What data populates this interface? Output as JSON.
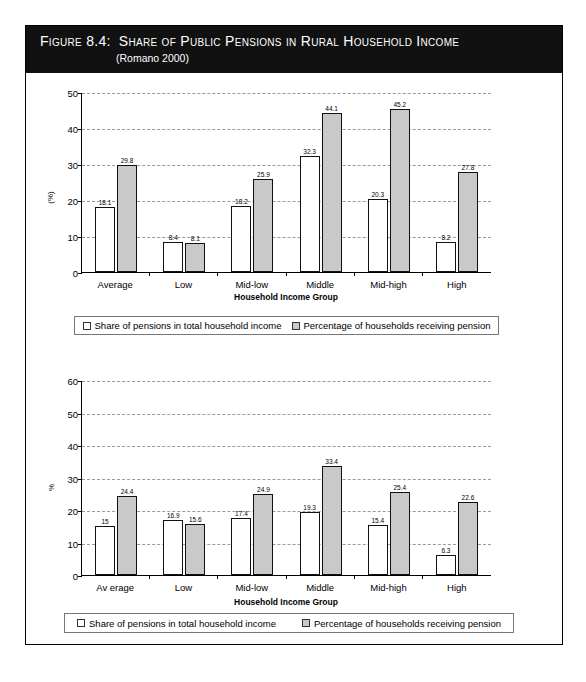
{
  "figure": {
    "number_label": "Figure 8.4:",
    "title": "Share of Public Pensions in Rural Household Income",
    "subtitle": "(Romano 2000)"
  },
  "colors": {
    "series_white": "#ffffff",
    "series_gray": "#c9c9c9",
    "header_background": "#111111",
    "header_text": "#ffffff",
    "gridline": "#9a9a9a",
    "axis": "#000000"
  },
  "legend": {
    "series_1": "Share of pensions in total household income",
    "series_2": "Percentage of households receiving pension"
  },
  "chart_data": [
    {
      "type": "bar",
      "title": "",
      "xlabel": "Household Income Group",
      "ylabel": "(%)",
      "categories": [
        "Average",
        "Low",
        "Mid-low",
        "Middle",
        "Mid-high",
        "High"
      ],
      "series": [
        {
          "name": "Share of pensions in total household income",
          "color": "#ffffff",
          "values": [
            18.1,
            8.4,
            18.2,
            32.3,
            20.3,
            8.2
          ],
          "labels": [
            "18.1",
            "8.4",
            "18.2",
            "32.3",
            "20.3",
            "8.2"
          ]
        },
        {
          "name": "Percentage of households receiving pension",
          "color": "#c9c9c9",
          "values": [
            29.8,
            8.1,
            25.9,
            44.1,
            45.2,
            27.8
          ],
          "labels": [
            "29.8",
            "8.1",
            "25.9",
            "44.1",
            "45.2",
            "27.8"
          ]
        }
      ],
      "ylim": [
        0,
        50
      ],
      "yticks": [
        0,
        10,
        20,
        30,
        40,
        50
      ],
      "ytick_labels": [
        "0",
        "10",
        "20",
        "30",
        "40",
        "50"
      ],
      "grid": true,
      "legend_position": "bottom"
    },
    {
      "type": "bar",
      "title": "",
      "xlabel": "Household Income Group",
      "ylabel": "%",
      "categories": [
        "Av erage",
        "Low",
        "Mid-low",
        "Middle",
        "Mid-high",
        "High"
      ],
      "series": [
        {
          "name": "Share of pensions in total household income",
          "color": "#ffffff",
          "values": [
            15,
            16.9,
            17.4,
            19.3,
            15.4,
            6.3
          ],
          "labels": [
            "15",
            "16.9",
            "17.4",
            "19.3",
            "15.4",
            "6.3"
          ]
        },
        {
          "name": "Percentage of households receiving pension",
          "color": "#c9c9c9",
          "values": [
            24.4,
            15.6,
            24.9,
            33.4,
            25.4,
            22.6
          ],
          "labels": [
            "24.4",
            "15.6",
            "24.9",
            "33.4",
            "25.4",
            "22.6"
          ]
        }
      ],
      "ylim": [
        0,
        60
      ],
      "yticks": [
        0,
        10,
        20,
        30,
        40,
        50,
        60
      ],
      "ytick_labels": [
        "0",
        "10",
        "20",
        "30",
        "40",
        "50",
        "60"
      ],
      "grid": true,
      "legend_position": "bottom"
    }
  ]
}
